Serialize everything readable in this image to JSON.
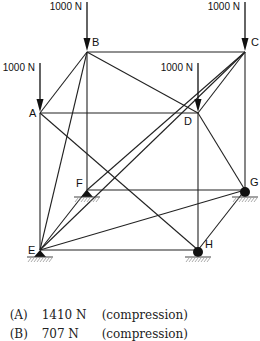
{
  "diagram": {
    "nodes": {
      "A": {
        "label": "A"
      },
      "B": {
        "label": "B"
      },
      "C": {
        "label": "C"
      },
      "D": {
        "label": "D"
      },
      "E": {
        "label": "E"
      },
      "F": {
        "label": "F"
      },
      "G": {
        "label": "G"
      },
      "H": {
        "label": "H"
      }
    },
    "loads": [
      {
        "node": "B",
        "label": "1000 N"
      },
      {
        "node": "C",
        "label": "1000 N"
      },
      {
        "node": "A",
        "label": "1000 N"
      },
      {
        "node": "D",
        "label": "1000 N"
      }
    ],
    "supports": [
      {
        "node": "E",
        "type": "pin"
      },
      {
        "node": "F",
        "type": "pin"
      },
      {
        "node": "G",
        "type": "roller"
      },
      {
        "node": "H",
        "type": "roller"
      }
    ],
    "members": [
      [
        "A",
        "B"
      ],
      [
        "B",
        "C"
      ],
      [
        "A",
        "D"
      ],
      [
        "D",
        "C"
      ],
      [
        "A",
        "E"
      ],
      [
        "B",
        "F"
      ],
      [
        "C",
        "G"
      ],
      [
        "D",
        "H"
      ],
      [
        "E",
        "H"
      ],
      [
        "F",
        "G"
      ],
      [
        "H",
        "G"
      ],
      [
        "E",
        "F"
      ],
      [
        "B",
        "E"
      ],
      [
        "E",
        "G"
      ],
      [
        "A",
        "H"
      ],
      [
        "B",
        "D"
      ],
      [
        "F",
        "C"
      ],
      [
        "D",
        "G"
      ],
      [
        "E",
        "C"
      ]
    ]
  },
  "options": [
    {
      "key": "(A)",
      "value": "1410 N",
      "note": "(compression)"
    },
    {
      "key": "(B)",
      "value": "707 N",
      "note": "(compression)"
    }
  ]
}
